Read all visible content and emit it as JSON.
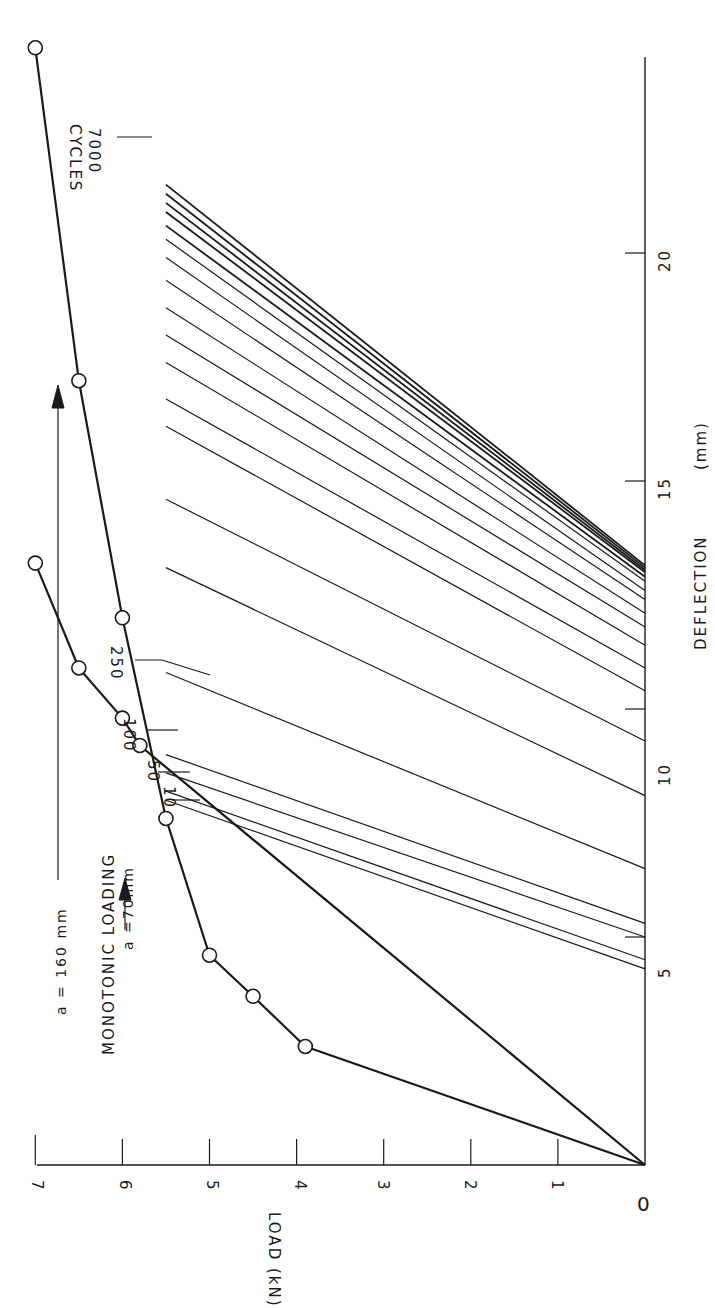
{
  "chart_data": {
    "type": "line",
    "title": "",
    "orientation": "figure rotated 90 degrees counter-clockwise on page",
    "xlabel": "DEFLECTION (mm)",
    "ylabel": "LOAD (kN)",
    "xlim": [
      0,
      25
    ],
    "ylim": [
      0,
      7
    ],
    "x_ticks": [
      0,
      5,
      10,
      15,
      20
    ],
    "y_ticks": [
      0,
      1,
      2,
      3,
      4,
      5,
      6,
      7
    ],
    "grid": false,
    "series": [
      {
        "name": "Monotonic loading a = 70mm",
        "style": "thick line with open circle markers",
        "points": [
          [
            0,
            0
          ],
          [
            2.6,
            3.9
          ],
          [
            3.7,
            4.5
          ],
          [
            4.6,
            5.0
          ],
          [
            7.6,
            5.5
          ],
          [
            12.0,
            6.0
          ],
          [
            17.2,
            6.5
          ],
          [
            24.5,
            7.0
          ]
        ]
      },
      {
        "name": "Monotonic loading a = 160mm",
        "style": "thick line with open circle markers",
        "points": [
          [
            0,
            0
          ],
          [
            9.2,
            5.8
          ],
          [
            9.8,
            6.0
          ],
          [
            10.9,
            6.5
          ],
          [
            13.2,
            7.0
          ]
        ]
      },
      {
        "name": "Cyclic unloading lines",
        "style": "thin lines, load 5.5 kN down to 0",
        "cycle_labels": [
          "10",
          "50",
          "100",
          "250",
          "7000 CYCLES"
        ],
        "lines": [
          {
            "from": [
              8.0,
              5.5
            ],
            "to": [
              4.3,
              0
            ]
          },
          {
            "from": [
              8.2,
              5.5
            ],
            "to": [
              4.5,
              0
            ]
          },
          {
            "from": [
              8.6,
              5.5
            ],
            "to": [
              5.0,
              0
            ]
          },
          {
            "from": [
              9.0,
              5.5
            ],
            "to": [
              5.3,
              0
            ]
          },
          {
            "from": [
              10.8,
              5.5
            ],
            "to": [
              6.5,
              0
            ]
          },
          {
            "from": [
              13.1,
              5.5
            ],
            "to": [
              8.1,
              0
            ]
          },
          {
            "from": [
              14.6,
              5.5
            ],
            "to": [
              9.3,
              0
            ]
          },
          {
            "from": [
              16.2,
              5.5
            ],
            "to": [
              10.4,
              0
            ]
          },
          {
            "from": [
              16.8,
              5.5
            ],
            "to": [
              10.9,
              0
            ]
          },
          {
            "from": [
              17.6,
              5.5
            ],
            "to": [
              11.4,
              0
            ]
          },
          {
            "from": [
              18.2,
              5.5
            ],
            "to": [
              11.8,
              0
            ]
          },
          {
            "from": [
              18.8,
              5.5
            ],
            "to": [
              12.1,
              0
            ]
          },
          {
            "from": [
              19.4,
              5.5
            ],
            "to": [
              12.4,
              0
            ]
          },
          {
            "from": [
              19.9,
              5.5
            ],
            "to": [
              12.6,
              0
            ]
          },
          {
            "from": [
              20.3,
              5.5
            ],
            "to": [
              12.8,
              0
            ]
          },
          {
            "from": [
              20.6,
              5.5
            ],
            "to": [
              12.9,
              0
            ]
          },
          {
            "from": [
              20.9,
              5.5
            ],
            "to": [
              13.0,
              0
            ]
          },
          {
            "from": [
              21.1,
              5.5
            ],
            "to": [
              13.05,
              0
            ]
          },
          {
            "from": [
              21.3,
              5.5
            ],
            "to": [
              13.1,
              0
            ]
          },
          {
            "from": [
              21.5,
              5.5
            ],
            "to": [
              13.15,
              0
            ]
          }
        ]
      }
    ],
    "annotations": [
      "MONOTONIC LOADING",
      "a = 160 mm",
      "a = 70mm",
      "10",
      "50",
      "100",
      "250",
      "7000",
      "CYCLES"
    ]
  },
  "labels": {
    "xlabel": "DEFLECTION",
    "xunit": "(mm)",
    "ylabel": "LOAD (kN)",
    "monotonic": "MONOTONIC  LOADING",
    "a160": "a = 160 mm",
    "a70": "a =70mm",
    "c10": "10",
    "c50": "50",
    "c100": "100",
    "c250": "250",
    "c7000": "7000",
    "cycles": "CYCLES",
    "xt0": "0",
    "xt5": "5",
    "xt10": "10",
    "xt15": "15",
    "xt20": "20",
    "yt1": "1",
    "yt2": "2",
    "yt3": "3",
    "yt4": "4",
    "yt5": "5",
    "yt6": "6",
    "yt7": "7"
  },
  "colors": {
    "ink": "#1a1a1a",
    "paper": "#ffffff"
  }
}
